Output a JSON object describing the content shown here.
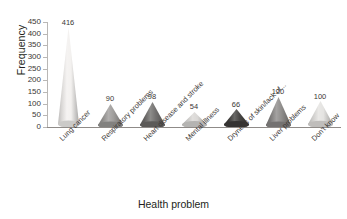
{
  "chart_data": {
    "type": "bar",
    "title": "",
    "subtitle": "",
    "xlabel": "Health problem",
    "ylabel": "Frequency",
    "categories": [
      "Lung cancer",
      "Respiratory problems",
      "Heart disease and stroke",
      "Mental illness",
      "Dryness of skin/lack of...",
      "Liver problems",
      "Don't know"
    ],
    "values": [
      416,
      90,
      98,
      54,
      66,
      120,
      100
    ],
    "value_labels": [
      "416",
      "90",
      "98",
      "54",
      "66",
      "120",
      "100"
    ],
    "ylim": [
      0,
      450
    ],
    "ytick_values": [
      0,
      50,
      100,
      150,
      200,
      250,
      300,
      350,
      400,
      450
    ],
    "ytick_labels": [
      "0",
      "50",
      "100",
      "150",
      "200",
      "250",
      "300",
      "350",
      "400",
      "450"
    ],
    "grid": false,
    "legend": "none",
    "marker_style": "3d-cone",
    "series_colors": [
      "#f2f0ee",
      "#9b9997",
      "#6d6b69",
      "#d8d6d4",
      "#3f3d3b",
      "#8a8886",
      "#e3e1df"
    ],
    "axis_color": "#8f8b88",
    "text_color": "#231f20"
  }
}
